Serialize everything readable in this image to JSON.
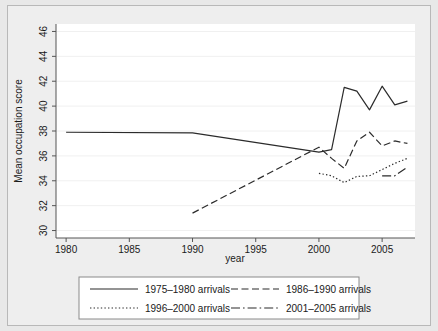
{
  "chart_data": {
    "type": "line",
    "title": "",
    "xlabel": "year",
    "ylabel": "Mean occupation score",
    "xlim": [
      1979.2,
      2007.6
    ],
    "ylim": [
      29.4,
      46.6
    ],
    "xticks": [
      1980,
      1985,
      1990,
      1995,
      2000,
      2005
    ],
    "xtick_labels": [
      "1980",
      "1985",
      "1990",
      "1995",
      "2000",
      "2005"
    ],
    "yticks": [
      30,
      32,
      34,
      36,
      38,
      40,
      42,
      44,
      46
    ],
    "ytick_labels": [
      "30",
      "32",
      "34",
      "36",
      "38",
      "40",
      "42",
      "44",
      "46"
    ],
    "grid": "horizontal",
    "legend_position": "bottom-outside",
    "series": [
      {
        "name": "1975–1980 arrivals",
        "style": "solid",
        "x": [
          1980,
          1990,
          2000,
          2001,
          2002,
          2003,
          2004,
          2005,
          2006,
          2007
        ],
        "values": [
          37.9,
          37.85,
          36.3,
          36.5,
          41.5,
          41.2,
          39.7,
          41.6,
          40.1,
          40.4
        ]
      },
      {
        "name": "1986–1990 arrivals",
        "style": "dashed",
        "x": [
          1990,
          2000,
          2001,
          2002,
          2003,
          2004,
          2005,
          2006,
          2007
        ],
        "values": [
          31.4,
          36.7,
          35.8,
          35.0,
          37.2,
          37.9,
          36.8,
          37.2,
          37.0
        ]
      },
      {
        "name": "1996–2000 arrivals",
        "style": "dotted",
        "x": [
          2000,
          2001,
          2002,
          2003,
          2004,
          2005,
          2006,
          2007
        ],
        "values": [
          34.6,
          34.4,
          33.85,
          34.35,
          34.4,
          34.9,
          35.4,
          35.8
        ]
      },
      {
        "name": "2001–2005 arrivals",
        "style": "dash-dot",
        "x": [
          2005,
          2006,
          2007
        ],
        "values": [
          34.4,
          34.4,
          35.1
        ]
      }
    ],
    "legend_entries": [
      {
        "label": "1975–1980 arrivals",
        "style": "solid"
      },
      {
        "label": "1986–1990 arrivals",
        "style": "dashed"
      },
      {
        "label": "1996–2000 arrivals",
        "style": "dotted"
      },
      {
        "label": "2001–2005 arrivals",
        "style": "dash-dot"
      }
    ],
    "colors": {
      "line": "#2b2b2b",
      "grid": "#f0f0f0",
      "axis": "#555555",
      "plot_background": "#ffffff",
      "figure_background": "#eeeeee",
      "outer_background": "#e8e8e8"
    }
  }
}
